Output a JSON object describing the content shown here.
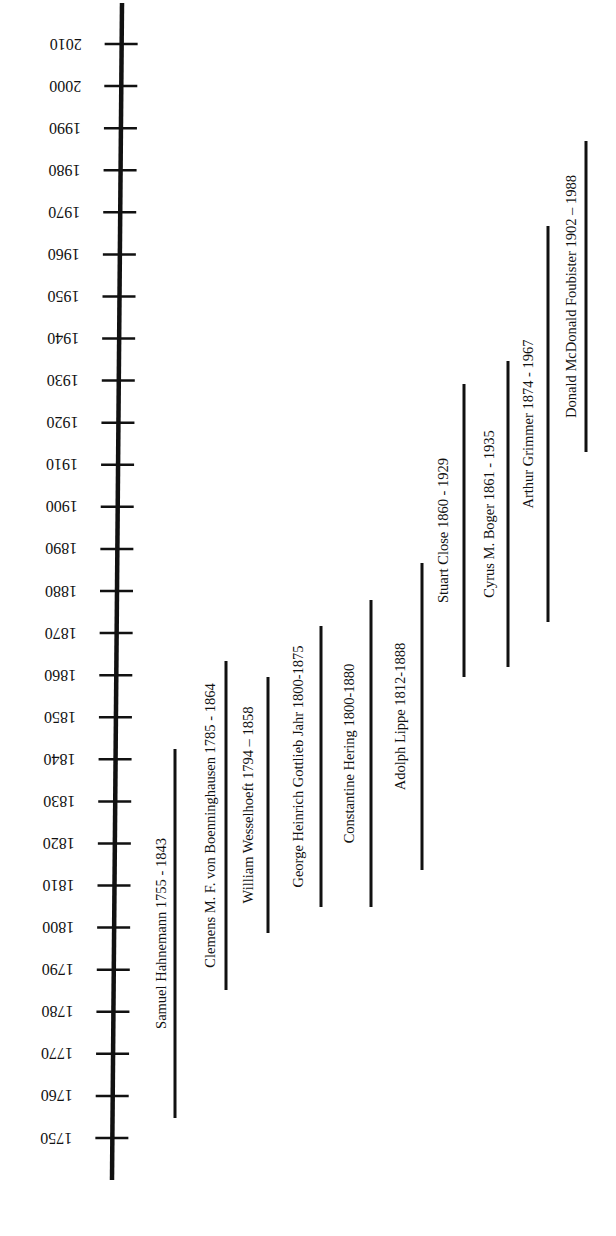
{
  "chart_data": {
    "type": "timeline",
    "title": "",
    "orientation": "vertical axis, years increasing upward; labels rotated",
    "axis": {
      "min_year": 1750,
      "max_year": 2010,
      "tick_step": 10,
      "tick_labels": [
        "1750",
        "1760",
        "1770",
        "1780",
        "1790",
        "1800",
        "1810",
        "1820",
        "1830",
        "1840",
        "1850",
        "1860",
        "1870",
        "1880",
        "1890",
        "1900",
        "1910",
        "1920",
        "1930",
        "1940",
        "1950",
        "1960",
        "1970",
        "1980",
        "1990",
        "2000",
        "2010"
      ]
    },
    "series": [
      {
        "name": "Samuel Hahnemann",
        "label": "Samuel Hahnemann 1755 - 1843",
        "start": 1755,
        "end": 1843
      },
      {
        "name": "Clemens M. F. von Boenninghausen",
        "label": "Clemens M. F. von Boenninghausen 1785 - 1864",
        "start": 1785,
        "end": 1864
      },
      {
        "name": "William Wesselhoeft",
        "label": "William Wesselhoeft 1794 – 1858",
        "start": 1794,
        "end": 1858
      },
      {
        "name": "George Heinrich Gottlieb Jahr",
        "label": "George Heinrich Gottlieb Jahr 1800-1875",
        "start": 1800,
        "end": 1875
      },
      {
        "name": "Constantine Hering",
        "label": "Constantine Hering 1800-1880",
        "start": 1800,
        "end": 1880
      },
      {
        "name": "Adolph Lippe",
        "label": "Adolph Lippe 1812-1888",
        "start": 1812,
        "end": 1888
      },
      {
        "name": "Stuart Close",
        "label": "Stuart Close 1860 - 1929",
        "start": 1860,
        "end": 1929
      },
      {
        "name": "Cyrus M. Boger",
        "label": "Cyrus M. Boger 1861 - 1935",
        "start": 1861,
        "end": 1935
      },
      {
        "name": "Arthur Grimmer",
        "label": "Arthur Grimmer 1874 - 1967",
        "start": 1874,
        "end": 1967
      },
      {
        "name": "Donald McDonald Foubister",
        "label": "Donald McDonald Foubister 1902 – 1988",
        "start": 1902,
        "end": 1988
      }
    ],
    "xlabel": "",
    "ylabel": "",
    "grid": false,
    "legend": "none"
  },
  "colors": {
    "ink": "#111111",
    "background": "#ffffff"
  },
  "layout_px": {
    "axis": {
      "x_top": 122,
      "x_bottom": 112,
      "y_top": 3,
      "y_bottom": 1180
    },
    "ticks_y": {
      "2010": 44,
      "1750": 1138
    },
    "bars": [
      {
        "x": 175,
        "y1": 749,
        "y2": 1118,
        "label_x": 161
      },
      {
        "x": 226,
        "y1": 661,
        "y2": 990,
        "label_x": 210
      },
      {
        "x": 268,
        "y1": 677,
        "y2": 933,
        "label_x": 248
      },
      {
        "x": 321,
        "y1": 626,
        "y2": 907,
        "label_x": 298
      },
      {
        "x": 371,
        "y1": 600,
        "y2": 907,
        "label_x": 349
      },
      {
        "x": 422,
        "y1": 563,
        "y2": 870,
        "label_x": 400
      },
      {
        "x": 464,
        "y1": 384,
        "y2": 677,
        "label_x": 443
      },
      {
        "x": 508,
        "y1": 361,
        "y2": 667,
        "label_x": 489
      },
      {
        "x": 548,
        "y1": 226,
        "y2": 622,
        "label_x": 528
      },
      {
        "x": 586,
        "y1": 141,
        "y2": 452,
        "label_x": 571
      }
    ]
  }
}
